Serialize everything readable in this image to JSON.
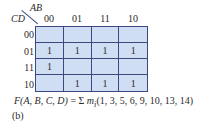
{
  "kmap": {
    "row_var": "CD",
    "col_var": "AB",
    "col_headers": [
      "00",
      "01",
      "11",
      "10"
    ],
    "row_headers": [
      "00",
      "01",
      "11",
      "10"
    ],
    "cells": [
      [
        "",
        "",
        "",
        ""
      ],
      [
        "1",
        "1",
        "1",
        "1"
      ],
      [
        "1",
        "",
        "",
        ""
      ],
      [
        "",
        "1",
        "1",
        "1"
      ]
    ],
    "fill_color": "#cfdef3",
    "line_color": "#3a4a80"
  },
  "formula": {
    "lhs": "F(A, B, C, D)",
    "equals": " = ",
    "sigma": "Σ",
    "m": "m",
    "sub": "i",
    "minterms": "(1, 3, 5, 6, 9, 10, 13, 14)"
  },
  "caption": "(b)"
}
